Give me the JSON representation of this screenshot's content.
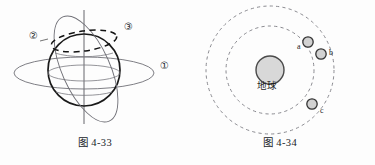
{
  "page": {
    "background_color": "#fdfdfd",
    "ink_color": "#1c1c1c"
  },
  "figures": [
    {
      "id": "fig-4-33",
      "caption": "图 4-33",
      "description": "sphere with three orbit rings",
      "colors": {
        "sphere_outline": "#1a1a1a",
        "ring_thin": "#6b6b72",
        "dashed_ring": "#111111",
        "axis": "#55555c"
      },
      "labels": [
        {
          "key": "ring2",
          "text": "②",
          "x": 29,
          "y": 36
        },
        {
          "key": "ring3",
          "text": "③",
          "x": 124,
          "y": 27
        },
        {
          "key": "ring1",
          "text": "①",
          "x": 160,
          "y": 66
        }
      ]
    },
    {
      "id": "fig-4-34",
      "caption": "图 4-34",
      "description": "Earth with two dashed circular orbits and three satellites",
      "colors": {
        "orbit_dashed": "#8a8a90",
        "earth_fill": "#d6d6d6",
        "earth_outline": "#4a4a4a",
        "satellite_fill": "#cfcfcf",
        "satellite_outline": "#3a3a3a"
      },
      "center_body": {
        "label": "地球",
        "label_x": 104,
        "label_y": 86
      },
      "orbits": [
        {
          "key": "inner-orbit",
          "radius": 44
        },
        {
          "key": "outer-orbit",
          "radius": 64
        }
      ],
      "satellites": [
        {
          "key": "a",
          "label": "a",
          "label_x": 112,
          "label_y": 46,
          "cx": 123,
          "cy": 42,
          "r": 5.2
        },
        {
          "key": "b",
          "label": "b",
          "label_x": 144,
          "label_y": 51,
          "cx": 135,
          "cy": 53,
          "r": 5.2
        },
        {
          "key": "c",
          "label": "c",
          "label_x": 136,
          "label_y": 110,
          "cx": 127,
          "cy": 104,
          "r": 5.2
        }
      ]
    }
  ]
}
